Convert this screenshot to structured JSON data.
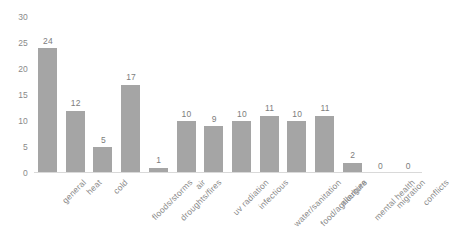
{
  "chart_data": {
    "type": "bar",
    "title": "",
    "xlabel": "",
    "ylabel": "",
    "ylim": [
      0,
      30
    ],
    "grid": false,
    "legend": "none",
    "bar_color": "#a5a5a5",
    "axis_color": "#d9d9d9",
    "label_color": "#8a8a8a",
    "y_ticks": [
      "0",
      "5",
      "10",
      "15",
      "20",
      "25",
      "30"
    ],
    "categories": [
      "general",
      "heat",
      "cold",
      "floods/storms",
      "droughts/fires",
      "air",
      "uv radiation",
      "infectious",
      "water/sanitation",
      "food/agriculture",
      "allergies",
      "mental health",
      "migration",
      "conflicts"
    ],
    "values": [
      24,
      12,
      5,
      17,
      1,
      10,
      9,
      10,
      11,
      10,
      11,
      2,
      0,
      0
    ],
    "data_labels": [
      "24",
      "12",
      "5",
      "17",
      "1",
      "10",
      "9",
      "10",
      "11",
      "10",
      "11",
      "2",
      "0",
      "0"
    ]
  }
}
